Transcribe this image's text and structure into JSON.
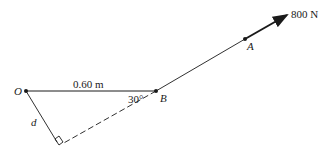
{
  "diagram": {
    "points": {
      "O": {
        "label": "O",
        "x": 26,
        "y": 91
      },
      "B": {
        "label": "B",
        "x": 156,
        "y": 91
      },
      "A": {
        "label": "A",
        "x": 245,
        "y": 39
      }
    },
    "force": {
      "label": "800 N",
      "tip_x": 287,
      "tip_y": 15
    },
    "distance_OB": "0.60 m",
    "angle_B": "30°",
    "perpendicular_distance": "d",
    "colors": {
      "line": "#1a1a1a",
      "background": "#ffffff"
    }
  }
}
